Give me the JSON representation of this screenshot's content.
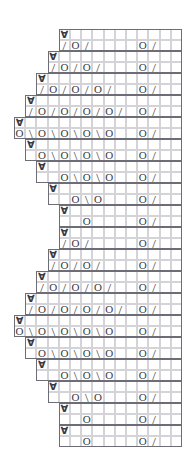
{
  "chart_data": {
    "type": "table",
    "title": "",
    "grid": {
      "columns": 15,
      "rows": 38,
      "cell_width": 11.2,
      "cell_height": 11.0,
      "origin_x": 14,
      "origin_y": 29,
      "grid_line_color": "#d3d3d8",
      "outline_color": "#6d6d78",
      "symbol_color": "#3a3a42",
      "background": "#ffffff"
    },
    "legend": [
      {
        "symbol": "O",
        "name": "yarn-over"
      },
      {
        "symbol": "/",
        "name": "right-leaning-decrease"
      },
      {
        "symbol": "\\",
        "name": "left-leaning-decrease"
      },
      {
        "symbol": "∀",
        "name": "stitch-marker"
      }
    ],
    "rows": [
      {
        "index": 1,
        "start_col": 5,
        "end_col": 15,
        "cells": {
          "5": "∀"
        }
      },
      {
        "index": 2,
        "start_col": 5,
        "end_col": 15,
        "cells": {
          "5": "/",
          "6": "O",
          "7": "/",
          "12": "O",
          "13": "/"
        }
      },
      {
        "index": 3,
        "start_col": 4,
        "end_col": 15,
        "cells": {
          "4": "∀"
        }
      },
      {
        "index": 4,
        "start_col": 4,
        "end_col": 15,
        "cells": {
          "4": "/",
          "5": "O",
          "6": "/",
          "7": "O",
          "8": "/",
          "12": "O",
          "13": "/"
        }
      },
      {
        "index": 5,
        "start_col": 3,
        "end_col": 15,
        "cells": {
          "3": "∀"
        }
      },
      {
        "index": 6,
        "start_col": 3,
        "end_col": 15,
        "cells": {
          "3": "/",
          "4": "O",
          "5": "/",
          "6": "O",
          "7": "/",
          "8": "O",
          "9": "/",
          "12": "O",
          "13": "/"
        }
      },
      {
        "index": 7,
        "start_col": 2,
        "end_col": 15,
        "cells": {
          "2": "∀"
        }
      },
      {
        "index": 8,
        "start_col": 2,
        "end_col": 15,
        "cells": {
          "2": "/",
          "3": "O",
          "4": "/",
          "5": "O",
          "6": "/",
          "7": "O",
          "8": "/",
          "9": "O",
          "10": "/",
          "12": "O",
          "13": "/"
        }
      },
      {
        "index": 9,
        "start_col": 1,
        "end_col": 15,
        "cells": {
          "1": "∀"
        }
      },
      {
        "index": 10,
        "start_col": 1,
        "end_col": 15,
        "cells": {
          "1": "O",
          "2": "\\",
          "3": "O",
          "4": "\\",
          "5": "O",
          "6": "\\",
          "7": "O",
          "8": "\\",
          "9": "O",
          "12": "O",
          "13": "/"
        }
      },
      {
        "index": 11,
        "start_col": 2,
        "end_col": 15,
        "cells": {
          "2": "∀"
        }
      },
      {
        "index": 12,
        "start_col": 2,
        "end_col": 15,
        "cells": {
          "3": "O",
          "4": "\\",
          "5": "O",
          "6": "\\",
          "7": "O",
          "8": "\\",
          "9": "O",
          "12": "O",
          "13": "/"
        }
      },
      {
        "index": 13,
        "start_col": 3,
        "end_col": 15,
        "cells": {
          "3": "∀"
        }
      },
      {
        "index": 14,
        "start_col": 3,
        "end_col": 15,
        "cells": {
          "5": "O",
          "6": "\\",
          "7": "O",
          "8": "\\",
          "9": "O",
          "12": "O",
          "13": "/"
        }
      },
      {
        "index": 15,
        "start_col": 4,
        "end_col": 15,
        "cells": {
          "4": "∀"
        }
      },
      {
        "index": 16,
        "start_col": 4,
        "end_col": 15,
        "cells": {
          "6": "O",
          "7": "\\",
          "8": "O",
          "12": "O",
          "13": "/"
        }
      },
      {
        "index": 17,
        "start_col": 5,
        "end_col": 15,
        "cells": {
          "5": "∀"
        }
      },
      {
        "index": 18,
        "start_col": 5,
        "end_col": 15,
        "cells": {
          "7": "O",
          "12": "O",
          "13": "/"
        }
      },
      {
        "index": 19,
        "start_col": 5,
        "end_col": 15,
        "cells": {
          "5": "∀"
        }
      },
      {
        "index": 20,
        "start_col": 5,
        "end_col": 15,
        "cells": {
          "5": "/",
          "6": "O",
          "7": "/",
          "12": "O",
          "13": "/"
        }
      },
      {
        "index": 21,
        "start_col": 4,
        "end_col": 15,
        "cells": {
          "4": "∀"
        }
      },
      {
        "index": 22,
        "start_col": 4,
        "end_col": 15,
        "cells": {
          "4": "/",
          "5": "O",
          "6": "/",
          "7": "O",
          "8": "/",
          "12": "O",
          "13": "/"
        }
      },
      {
        "index": 23,
        "start_col": 3,
        "end_col": 15,
        "cells": {
          "3": "∀"
        }
      },
      {
        "index": 24,
        "start_col": 3,
        "end_col": 15,
        "cells": {
          "3": "/",
          "4": "O",
          "5": "/",
          "6": "O",
          "7": "/",
          "8": "O",
          "9": "/",
          "12": "O",
          "13": "/"
        }
      },
      {
        "index": 25,
        "start_col": 2,
        "end_col": 15,
        "cells": {
          "2": "∀"
        }
      },
      {
        "index": 26,
        "start_col": 2,
        "end_col": 15,
        "cells": {
          "2": "/",
          "3": "O",
          "4": "/",
          "5": "O",
          "6": "/",
          "7": "O",
          "8": "/",
          "9": "O",
          "10": "/",
          "12": "O",
          "13": "/"
        }
      },
      {
        "index": 27,
        "start_col": 1,
        "end_col": 15,
        "cells": {
          "1": "∀"
        }
      },
      {
        "index": 28,
        "start_col": 1,
        "end_col": 15,
        "cells": {
          "1": "O",
          "2": "\\",
          "3": "O",
          "4": "\\",
          "5": "O",
          "6": "\\",
          "7": "O",
          "8": "\\",
          "9": "O",
          "12": "O",
          "13": "/"
        }
      },
      {
        "index": 29,
        "start_col": 2,
        "end_col": 15,
        "cells": {
          "2": "∀"
        }
      },
      {
        "index": 30,
        "start_col": 2,
        "end_col": 15,
        "cells": {
          "3": "O",
          "4": "\\",
          "5": "O",
          "6": "\\",
          "7": "O",
          "8": "\\",
          "9": "O",
          "12": "O",
          "13": "/"
        }
      },
      {
        "index": 31,
        "start_col": 3,
        "end_col": 15,
        "cells": {
          "3": "∀"
        }
      },
      {
        "index": 32,
        "start_col": 3,
        "end_col": 15,
        "cells": {
          "5": "O",
          "6": "\\",
          "7": "O",
          "8": "\\",
          "9": "O",
          "12": "O",
          "13": "/"
        }
      },
      {
        "index": 33,
        "start_col": 4,
        "end_col": 15,
        "cells": {
          "4": "∀"
        }
      },
      {
        "index": 34,
        "start_col": 4,
        "end_col": 15,
        "cells": {
          "6": "O",
          "7": "\\",
          "8": "O",
          "12": "O",
          "13": "/"
        }
      },
      {
        "index": 35,
        "start_col": 5,
        "end_col": 15,
        "cells": {
          "5": "∀"
        }
      },
      {
        "index": 36,
        "start_col": 5,
        "end_col": 15,
        "cells": {
          "7": "O",
          "12": "O",
          "13": "/"
        }
      },
      {
        "index": 37,
        "start_col": 5,
        "end_col": 15,
        "cells": {
          "5": "∀"
        }
      },
      {
        "index": 38,
        "start_col": 5,
        "end_col": 15,
        "cells": {
          "7": "O",
          "12": "O",
          "13": "/"
        }
      }
    ],
    "outline_blocks": [
      {
        "row_from": 1,
        "row_to": 2,
        "col_from": 5,
        "col_to": 15
      },
      {
        "row_from": 3,
        "row_to": 4,
        "col_from": 4,
        "col_to": 15
      },
      {
        "row_from": 5,
        "row_to": 6,
        "col_from": 3,
        "col_to": 15
      },
      {
        "row_from": 7,
        "row_to": 8,
        "col_from": 2,
        "col_to": 15
      },
      {
        "row_from": 9,
        "row_to": 10,
        "col_from": 1,
        "col_to": 15
      },
      {
        "row_from": 11,
        "row_to": 12,
        "col_from": 2,
        "col_to": 15
      },
      {
        "row_from": 13,
        "row_to": 14,
        "col_from": 3,
        "col_to": 15
      },
      {
        "row_from": 15,
        "row_to": 16,
        "col_from": 4,
        "col_to": 15
      },
      {
        "row_from": 17,
        "row_to": 18,
        "col_from": 5,
        "col_to": 15
      },
      {
        "row_from": 19,
        "row_to": 20,
        "col_from": 5,
        "col_to": 15
      },
      {
        "row_from": 21,
        "row_to": 22,
        "col_from": 4,
        "col_to": 15
      },
      {
        "row_from": 23,
        "row_to": 24,
        "col_from": 3,
        "col_to": 15
      },
      {
        "row_from": 25,
        "row_to": 26,
        "col_from": 2,
        "col_to": 15
      },
      {
        "row_from": 27,
        "row_to": 28,
        "col_from": 1,
        "col_to": 15
      },
      {
        "row_from": 29,
        "row_to": 30,
        "col_from": 2,
        "col_to": 15
      },
      {
        "row_from": 31,
        "row_to": 32,
        "col_from": 3,
        "col_to": 15
      },
      {
        "row_from": 33,
        "row_to": 34,
        "col_from": 4,
        "col_to": 15
      },
      {
        "row_from": 35,
        "row_to": 36,
        "col_from": 5,
        "col_to": 15
      },
      {
        "row_from": 37,
        "row_to": 38,
        "col_from": 5,
        "col_to": 15
      }
    ]
  }
}
